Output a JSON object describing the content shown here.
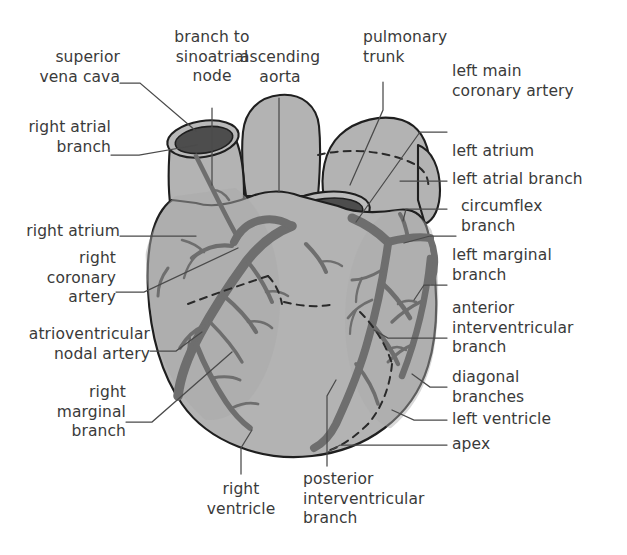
{
  "figure": {
    "palette": {
      "background": "#ffffff",
      "myocardium_fill": "#b3b3b3",
      "vessel_wall_fill": "#bcbcbc",
      "lumen_fill": "#4d4d4d",
      "artery_stroke": "#6e6e6e",
      "outline_stroke": "#1f1f1f",
      "leader_line": "#4a4a4a",
      "text": "#3a3a3a"
    }
  },
  "labels": {
    "superior_vena_cava": {
      "text": "superior\nvena cava",
      "align": "right"
    },
    "branch_to_sinoatrial_node": {
      "text": "branch to\nsinoatrial\nnode",
      "align": "center"
    },
    "ascending_aorta": {
      "text": "ascending\naorta",
      "align": "center"
    },
    "pulmonary_trunk": {
      "text": "pulmonary\ntrunk",
      "align": "left"
    },
    "right_atrial_branch": {
      "text": "right atrial\nbranch",
      "align": "right"
    },
    "left_main_coronary_artery": {
      "text": "left main\ncoronary artery",
      "align": "left"
    },
    "left_atrium": {
      "text": "left atrium",
      "align": "left"
    },
    "left_atrial_branch": {
      "text": "left atrial branch",
      "align": "left"
    },
    "circumflex_branch": {
      "text": "circumflex\nbranch",
      "align": "left"
    },
    "right_atrium": {
      "text": "right atrium",
      "align": "right"
    },
    "left_marginal_branch": {
      "text": "left marginal\nbranch",
      "align": "left"
    },
    "right_coronary_artery": {
      "text": "right\ncoronary\nartery",
      "align": "right"
    },
    "anterior_interventricular_branch": {
      "text": "anterior\ninterventricular\nbranch",
      "align": "left"
    },
    "atrioventricular_nodal_artery": {
      "text": "atrioventricular\nnodal artery",
      "align": "right"
    },
    "diagonal_branches": {
      "text": "diagonal\nbranches",
      "align": "left"
    },
    "right_marginal_branch": {
      "text": "right\nmarginal\nbranch",
      "align": "right"
    },
    "left_ventricle": {
      "text": "left ventricle",
      "align": "left"
    },
    "apex": {
      "text": "apex",
      "align": "left"
    },
    "right_ventricle": {
      "text": "right\nventricle",
      "align": "center"
    },
    "posterior_interventricular_branch": {
      "text": "posterior\ninterventricular\nbranch",
      "align": "left"
    }
  }
}
